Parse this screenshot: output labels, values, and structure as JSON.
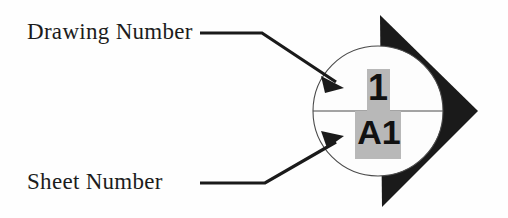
{
  "figure": {
    "kind": "drawing-reference-symbol",
    "background_color": "#fefefe",
    "ink_color": "#111111",
    "highlight_color": "#b8b8b8"
  },
  "callouts": [
    {
      "id": "drawing-number",
      "label": "Drawing Number",
      "points_to": "drawing-number-value"
    },
    {
      "id": "sheet-number",
      "label": "Sheet Number",
      "points_to": "sheet-number-value"
    }
  ],
  "symbol": {
    "drawing_number": "1",
    "sheet_number": "A1",
    "circle": {
      "cx": 378,
      "cy": 111,
      "r": 65
    },
    "divider_y": 111,
    "arrow_triangle": {
      "direction": "right",
      "tip": [
        478,
        111
      ],
      "top": [
        380,
        15
      ],
      "bottom": [
        382,
        207
      ]
    }
  }
}
